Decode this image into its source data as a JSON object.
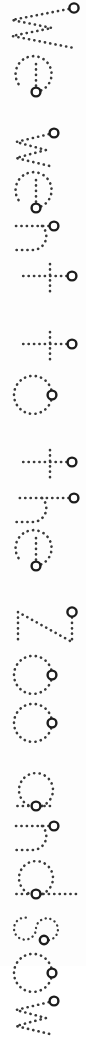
{
  "worksheet": {
    "type": "handwriting-tracing-worksheet",
    "orientation": "rotated-90-clockwise",
    "sentence": "We went to the Zoo and sow",
    "stroke_style": "dotted",
    "stroke_color": "#3a3a3a",
    "start_marker_color": "#1d1d1d",
    "background_color": "#fdfdfd",
    "canvas": {
      "width": 86,
      "height": 966
    },
    "words": [
      {
        "text": "We",
        "letters": [
          "W",
          "e"
        ]
      },
      {
        "text": "went",
        "letters": [
          "w",
          "e",
          "n",
          "t"
        ]
      },
      {
        "text": "to",
        "letters": [
          "t",
          "o"
        ]
      },
      {
        "text": "the",
        "letters": [
          "t",
          "h",
          "e"
        ]
      },
      {
        "text": "Zoo",
        "letters": [
          "Z",
          "o",
          "o"
        ]
      },
      {
        "text": "and",
        "letters": [
          "a",
          "n",
          "d"
        ]
      },
      {
        "text": "sow",
        "letters": [
          "s",
          "o",
          "w"
        ]
      }
    ],
    "letters": [
      {
        "char": "W",
        "case": "upper",
        "start_marker": true
      },
      {
        "char": "e",
        "case": "lower",
        "start_marker": true
      },
      {
        "char": "w",
        "case": "lower",
        "start_marker": true
      },
      {
        "char": "e",
        "case": "lower",
        "start_marker": true
      },
      {
        "char": "n",
        "case": "lower",
        "start_marker": true
      },
      {
        "char": "t",
        "case": "lower",
        "start_marker": true
      },
      {
        "char": "t",
        "case": "lower",
        "start_marker": true
      },
      {
        "char": "o",
        "case": "lower",
        "start_marker": true
      },
      {
        "char": "t",
        "case": "lower",
        "start_marker": true
      },
      {
        "char": "h",
        "case": "lower",
        "start_marker": true
      },
      {
        "char": "e",
        "case": "lower",
        "start_marker": true
      },
      {
        "char": "Z",
        "case": "upper",
        "start_marker": true
      },
      {
        "char": "o",
        "case": "lower",
        "start_marker": true
      },
      {
        "char": "o",
        "case": "lower",
        "start_marker": true
      },
      {
        "char": "a",
        "case": "lower",
        "start_marker": true
      },
      {
        "char": "n",
        "case": "lower",
        "start_marker": true
      },
      {
        "char": "d",
        "case": "lower",
        "start_marker": true
      },
      {
        "char": "s",
        "case": "lower",
        "start_marker": true
      },
      {
        "char": "o",
        "case": "lower",
        "start_marker": true
      },
      {
        "char": "w",
        "case": "lower",
        "start_marker": true
      }
    ]
  }
}
